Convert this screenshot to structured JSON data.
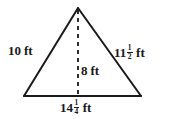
{
  "figure": {
    "type": "triangle-diagram",
    "stroke_color": "#1a1a1a",
    "background_color": "#ffffff",
    "labels": {
      "left_side": {
        "whole": "10",
        "numerator": "",
        "denominator": "",
        "unit": "ft",
        "value": 10
      },
      "right_side": {
        "whole": "11",
        "numerator": "1",
        "denominator": "2",
        "unit": "ft",
        "value": 11.5
      },
      "height": {
        "whole": "8",
        "numerator": "",
        "denominator": "",
        "unit": "ft",
        "value": 8
      },
      "base": {
        "whole": "14",
        "numerator": "1",
        "denominator": "4",
        "unit": "ft",
        "value": 14.25
      }
    },
    "geometry": {
      "apex": {
        "x": 78,
        "y": 8
      },
      "base_left": {
        "x": 24,
        "y": 96
      },
      "base_right": {
        "x": 141,
        "y": 96
      },
      "altitude_foot": {
        "x": 78,
        "y": 96
      }
    }
  }
}
